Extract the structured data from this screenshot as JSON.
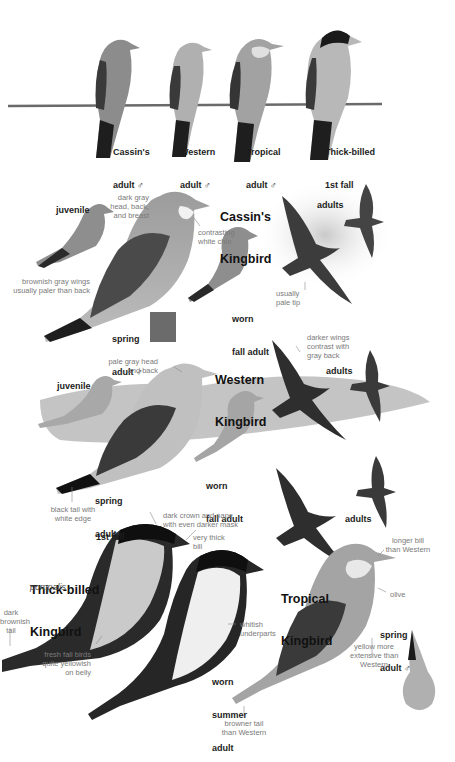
{
  "page": {
    "type": "field-guide-plate"
  },
  "wire_comparison": {
    "birds": [
      {
        "name": "Cassin's",
        "age": "adult ♂"
      },
      {
        "name": "Western",
        "age": "adult ♂"
      },
      {
        "name": "Tropical",
        "age": "adult ♂"
      },
      {
        "name": "Thick-billed",
        "age": "1st fall"
      }
    ]
  },
  "cassins": {
    "title_line1": "Cassin's",
    "title_line2": "Kingbird",
    "labels": {
      "juvenile": "juvenile",
      "spring_adult_1": "spring",
      "spring_adult_2": "adult ♂",
      "worn_fall_1": "worn",
      "worn_fall_2": "fall adult",
      "adults": "adults"
    },
    "notes": {
      "head": "dark gray\nhead, back,\nand breast",
      "chin": "contrasting\nwhite chin",
      "wings": "brownish gray wings\nusually paler than back",
      "tip": "usually\npale tip"
    }
  },
  "western": {
    "title_line1": "Western",
    "title_line2": "Kingbird",
    "labels": {
      "juvenile": "juvenile",
      "spring_adult_1": "spring",
      "spring_adult_2": "adult ♂",
      "worn_fall_1": "worn",
      "worn_fall_2": "fall adult",
      "adults": "adults"
    },
    "notes": {
      "head": "pale gray head\nand back",
      "wings": "darker wings\ncontrast with\ngray back",
      "tail": "black tail with\nwhite edge"
    }
  },
  "thick_billed": {
    "title_line1": "Thick-billed",
    "title_line2": "Kingbird",
    "subspecies": "pompalis",
    "labels": {
      "first_fall": "1st fall",
      "worn_summer_1": "worn",
      "worn_summer_2": "summer",
      "worn_summer_3": "adult"
    },
    "notes": {
      "crown": "dark crown and nape\nwith even darker mask",
      "bill": "very thick\nbill",
      "tail": "dark\nbrownish\ntail",
      "belly": "fresh fall birds\nquite yellowish\non belly",
      "underparts": "whitish\nunderparts"
    }
  },
  "tropical": {
    "title_line1": "Tropical",
    "title_line2": "Kingbird",
    "labels": {
      "adults": "adults",
      "spring_adult_1": "spring",
      "spring_adult_2": "adult ♂"
    },
    "notes": {
      "bill": "longer bill\nthan Western",
      "olive": "olive",
      "yellow": "yellow more\nextensive than\nWestern",
      "tail": "browner tail\nthan Western"
    }
  },
  "colors": {
    "background": "#ffffff",
    "label": "#1c1c1c",
    "note": "#7a7a7a",
    "bird_body": "#9a9a9a",
    "bird_dark": "#2a2a2a",
    "bird_light": "#d6d6d6"
  }
}
